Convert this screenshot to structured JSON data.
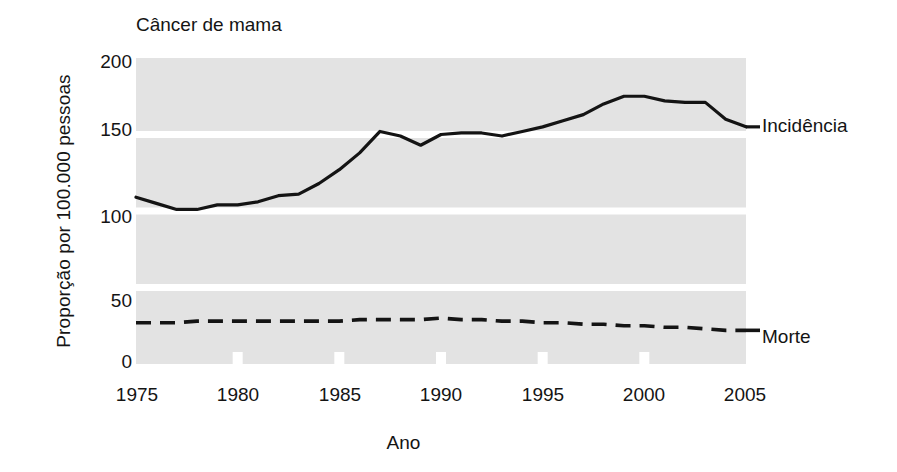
{
  "chart_data": {
    "type": "line",
    "title": "Câncer de mama",
    "xlabel": "Ano",
    "ylabel": "Proporção por 100.000 pessoas",
    "xlim": [
      1975,
      2005
    ],
    "ylim": [
      0,
      200
    ],
    "grid": true,
    "grid_style": "horizontal gray bands separated by white gaps at 50, 100, 150",
    "legend_position": "right-of-plot inline labels",
    "xticks": [
      "1975",
      "1980",
      "1985",
      "1990",
      "1995",
      "2000",
      "2005"
    ],
    "xtick_values": [
      1975,
      1980,
      1985,
      1990,
      1995,
      2000,
      2005
    ],
    "yticks": [
      "0",
      "50",
      "100",
      "150",
      "200"
    ],
    "ytick_values": [
      0,
      50,
      100,
      150,
      200
    ],
    "x": [
      1975,
      1976,
      1977,
      1978,
      1979,
      1980,
      1981,
      1982,
      1983,
      1984,
      1985,
      1986,
      1987,
      1988,
      1989,
      1990,
      1991,
      1992,
      1993,
      1994,
      1995,
      1996,
      1997,
      1998,
      1999,
      2000,
      2001,
      2002,
      2003,
      2004,
      2005
    ],
    "series": [
      {
        "name": "Incidência",
        "label": "Incidência",
        "style": "solid",
        "color": "#141414",
        "values": [
          109,
          105,
          101,
          101,
          104,
          104,
          106,
          110,
          111,
          118,
          127,
          138,
          152,
          149,
          143,
          150,
          151,
          151,
          149,
          152,
          155,
          159,
          163,
          170,
          175,
          175,
          172,
          171,
          171,
          160,
          155
        ]
      },
      {
        "name": "Morte",
        "label": "Morte",
        "style": "dashed",
        "color": "#141414",
        "values": [
          27,
          27,
          27,
          28,
          28,
          28,
          28,
          28,
          28,
          28,
          28,
          29,
          29,
          29,
          29,
          30,
          29,
          29,
          28,
          28,
          27,
          27,
          26,
          26,
          25,
          25,
          24,
          24,
          23,
          22,
          22
        ]
      }
    ]
  },
  "colors": {
    "band": "#e3e3e3",
    "gap": "#ffffff",
    "ink": "#141414",
    "background": "#ffffff"
  }
}
